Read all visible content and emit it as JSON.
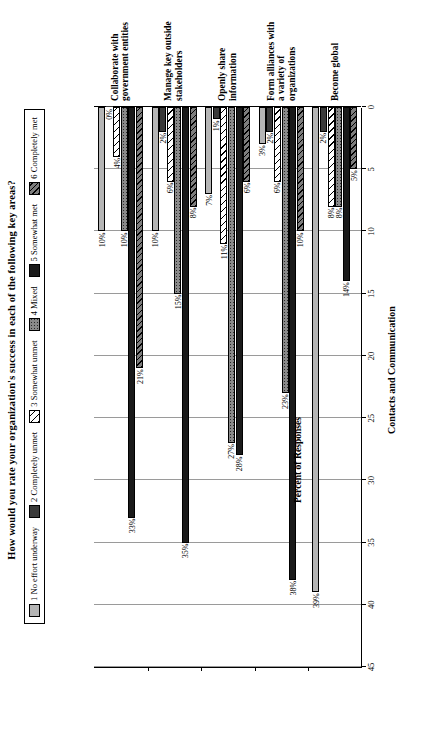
{
  "chart_data": {
    "type": "bar",
    "orientation": "horizontal",
    "title": "How would you rate your organization's success in each of the following key areas?",
    "footer": "Contacts and Communication",
    "xlabel": "Percent of Responses",
    "ylabel": "",
    "xlim": [
      0,
      45
    ],
    "xticks": [
      45,
      40,
      35,
      30,
      25,
      20,
      15,
      10,
      5,
      0
    ],
    "xtick_labels": [
      "45",
      "40",
      "35",
      "30",
      "25",
      "20",
      "15",
      "10",
      "5",
      "0"
    ],
    "grid": true,
    "legend_position": "top",
    "value_suffix": "%",
    "categories": [
      "Collaborate with government entities",
      "Manage key outside stakeholders",
      "Openly share information",
      "Form alliances with a variety of organizations",
      "Become global"
    ],
    "series": [
      {
        "name": "1 No effort underway",
        "key": "s1",
        "swatch": "light-gray",
        "values": [
          10,
          10,
          7,
          3,
          39
        ]
      },
      {
        "name": "2 Completely unmet",
        "key": "s2",
        "swatch": "dark-gray",
        "values": [
          0,
          2,
          1,
          2,
          2
        ]
      },
      {
        "name": "3 Somewhat unmet",
        "key": "s3",
        "swatch": "diagonal-hatch-white",
        "values": [
          4,
          6,
          11,
          6,
          8
        ]
      },
      {
        "name": "4 Mixed",
        "key": "s4",
        "swatch": "dotted-gray",
        "values": [
          10,
          15,
          27,
          23,
          8
        ]
      },
      {
        "name": "5 Somewhat met",
        "key": "s5",
        "swatch": "black",
        "values": [
          33,
          35,
          28,
          38,
          14
        ]
      },
      {
        "name": "6 Completely met",
        "key": "s6",
        "swatch": "diagonal-hatch-gray",
        "values": [
          21,
          8,
          6,
          10,
          5
        ]
      }
    ],
    "data_labels": [
      [
        "10%",
        "0%",
        "4%",
        "10%",
        "33%",
        "21%"
      ],
      [
        "10%",
        "2%",
        "6%",
        "15%",
        "35%",
        "8%"
      ],
      [
        "7%",
        "1%",
        "11%",
        "27%",
        "28%",
        "6%"
      ],
      [
        "3%",
        "2%",
        "6%",
        "23%",
        "38%",
        "10%"
      ],
      [
        "39%",
        "2%",
        "8%",
        "8%",
        "14%",
        "5%"
      ]
    ],
    "category_label_lines": [
      [
        "Collaborate with",
        "government entities"
      ],
      [
        "Manage key outside",
        "stakeholders"
      ],
      [
        "Openly share",
        "information"
      ],
      [
        "Form alliances with",
        "a variety of",
        "organizations"
      ],
      [
        "Become global"
      ]
    ]
  }
}
